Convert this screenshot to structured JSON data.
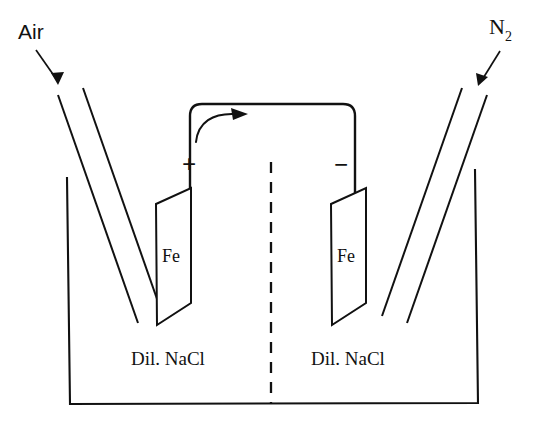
{
  "figure": {
    "background_color": "#ffffff",
    "ink_color": "#111111"
  },
  "gas_inlets": [
    {
      "id": "left-gas-inlet",
      "label": "Air",
      "subscript": "",
      "font_style": "sans-serif",
      "pointer": "arrow-down-right",
      "side": "left"
    },
    {
      "id": "right-gas-inlet",
      "label": "N",
      "subscript": "2",
      "font_style": "serif",
      "pointer": "arrow-down-left",
      "side": "right"
    }
  ],
  "electrodes": [
    {
      "id": "left-electrode",
      "label": "Fe",
      "polarity_sign": "+",
      "polarity_name": "positive-terminal",
      "side": "left"
    },
    {
      "id": "right-electrode",
      "label": "Fe",
      "polarity_sign": "−",
      "polarity_name": "negative-terminal",
      "side": "right"
    }
  ],
  "electrolytes": [
    {
      "id": "left-electrolyte",
      "label": "Dil. NaCl",
      "side": "left"
    },
    {
      "id": "right-electrolyte",
      "label": "Dil. NaCl",
      "side": "right"
    }
  ],
  "divider": {
    "id": "porous-divider",
    "style": "dashed-vertical"
  },
  "circuit": {
    "id": "external-circuit",
    "shape": "rounded-rectangle-wire",
    "flow_arrow": {
      "name": "current-flow-arrow",
      "direction": "left-to-right",
      "style": "curved"
    }
  },
  "vessel": {
    "id": "cell-vessel",
    "shape": "open-top-rectangular-tank"
  }
}
